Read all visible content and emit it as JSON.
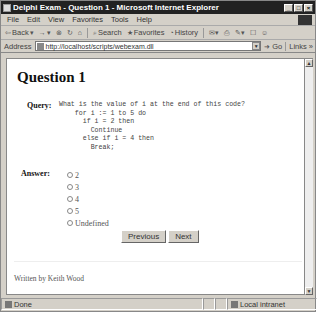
{
  "window": {
    "title": "Delphi Exam - Question 1 - Microsoft Internet Explorer",
    "controls": {
      "minimize": "_",
      "maximize": "□",
      "close": "×"
    }
  },
  "menu": [
    "File",
    "Edit",
    "View",
    "Favorites",
    "Tools",
    "Help"
  ],
  "toolbar": {
    "back": "Back",
    "forward": "→",
    "stop": "⊗",
    "refresh": "↻",
    "home": "⌂",
    "search": "Search",
    "favorites": "Favorites",
    "history": "History"
  },
  "address": {
    "label": "Address",
    "url": "http://localhost/scripts/webexam.dll",
    "go": "Go",
    "links": "Links"
  },
  "page": {
    "heading": "Question 1",
    "query_label": "Query:",
    "code": "What is the value of i at the end of this code?\n    for i := 1 to 5 do\n      if i = 2 then\n        Continue\n      else if i = 4 then\n        Break;",
    "answer_label": "Answer:",
    "options": [
      "2",
      "3",
      "4",
      "5",
      "Undefined"
    ],
    "previous_button": "Previous",
    "next_button": "Next",
    "footer": "Written by Keith Wood"
  },
  "status": {
    "text": "Done",
    "zone": "Local intranet"
  }
}
